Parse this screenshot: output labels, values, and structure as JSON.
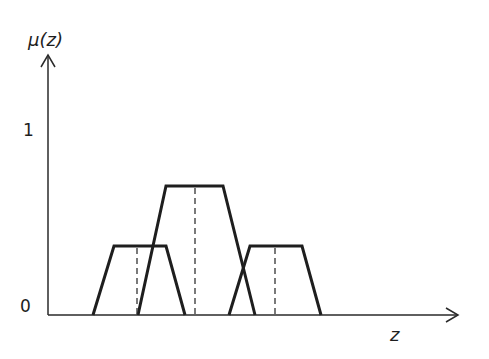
{
  "axes": {
    "y_label": "μ(z)",
    "x_label": "z",
    "y_ticks": [
      {
        "label": "1",
        "value": 1
      },
      {
        "label": "0",
        "value": 0
      }
    ]
  },
  "colors": {
    "line": "#1e1e1e",
    "axis": "#2a2a2a",
    "dashed": "#333333"
  },
  "membership_functions": [
    {
      "name": "left-trapezoid",
      "base": [
        93,
        185
      ],
      "top": [
        114,
        166
      ],
      "height_px": 246,
      "center": 137
    },
    {
      "name": "middle-trapezoid",
      "base": [
        138,
        255
      ],
      "top": [
        166,
        223
      ],
      "height_px": 186,
      "center": 195
    },
    {
      "name": "right-trapezoid",
      "base": [
        229,
        321
      ],
      "top": [
        250,
        302
      ],
      "height_px": 246,
      "center": 275
    }
  ]
}
